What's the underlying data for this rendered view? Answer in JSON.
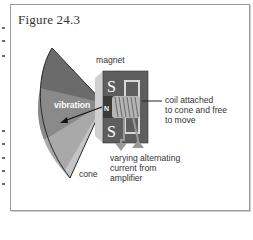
{
  "figure": {
    "title": "Figure 24.3",
    "labels": {
      "magnet": "magnet",
      "vibration": "vibration",
      "coil": [
        "coil attached",
        "to cone and free",
        "to move"
      ],
      "current": [
        "varying alternating",
        "current from",
        "amplifier"
      ],
      "cone": "cone",
      "pole_top": "S",
      "pole_bottom": "S",
      "pole_center": "N"
    },
    "colors": {
      "cone_dark": "#6b6b6b",
      "cone_mid": "#8a8a8a",
      "cone_light": "#a9a9a9",
      "cone_lighter": "#c4c4c4",
      "magnet_face": "#5e5e5e",
      "magnet_side": "#d0d0d0",
      "coil": "#b5b5b5",
      "wire": "#9a9a9a"
    }
  }
}
